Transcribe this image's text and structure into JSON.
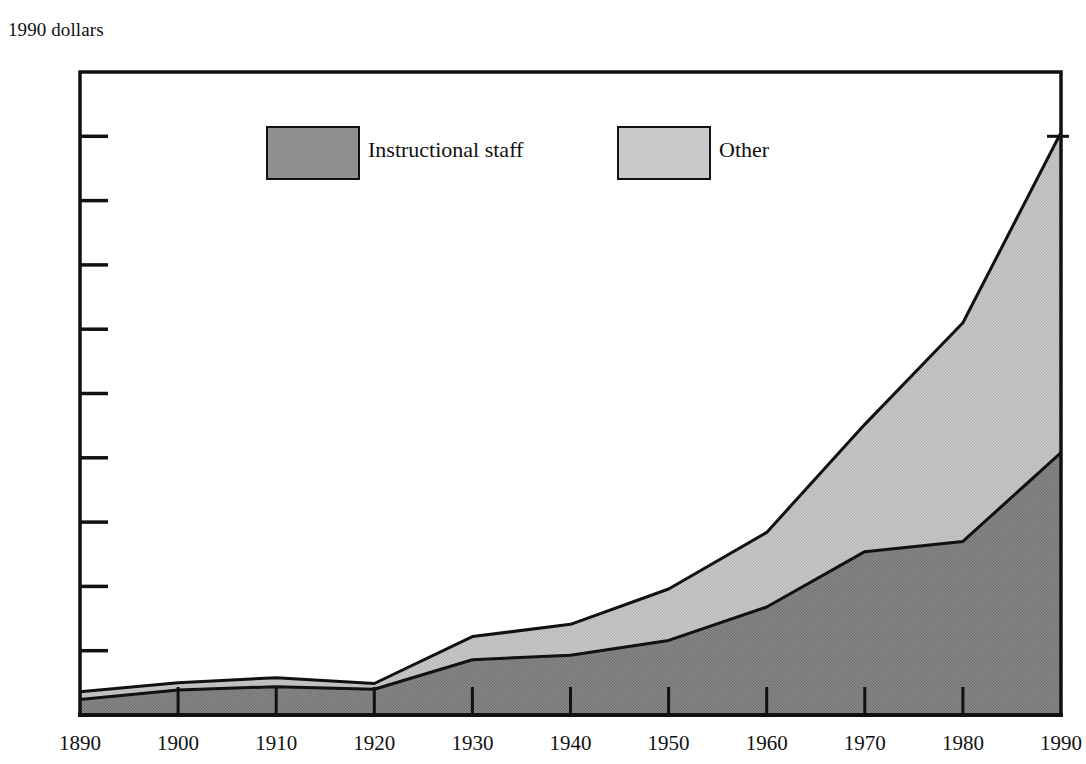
{
  "chart_data": {
    "type": "area",
    "title": "",
    "subtitle": "",
    "xlabel": "",
    "ylabel": "1990 dollars",
    "stacked": true,
    "grid": false,
    "legend_position": "top-center",
    "xlim": [
      1890,
      1990
    ],
    "ylim": [
      0,
      5000
    ],
    "x": [
      1890,
      1900,
      1910,
      1920,
      1930,
      1940,
      1950,
      1960,
      1970,
      1980,
      1990
    ],
    "categories": [
      "1890",
      "1900",
      "1910",
      "1920",
      "1930",
      "1940",
      "1950",
      "1960",
      "1970",
      "1980",
      "1990"
    ],
    "xticks": [
      "1890",
      "1900",
      "1910",
      "1920",
      "1930",
      "1940",
      "1950",
      "1960",
      "1970",
      "1980",
      "1990"
    ],
    "yticks": [
      "0",
      "500",
      "1,000",
      "1,500",
      "2,000",
      "2,500",
      "3,000",
      "3,500",
      "4,000",
      "4,500",
      "5,000"
    ],
    "ytick_values": [
      0,
      500,
      1000,
      1500,
      2000,
      2500,
      3000,
      3500,
      4000,
      4500,
      5000
    ],
    "series": [
      {
        "name": "Instructional staff",
        "color": "#8f8f8f",
        "values": [
          120,
          195,
          220,
          200,
          430,
          465,
          580,
          840,
          1270,
          1350,
          2040
        ]
      },
      {
        "name": "Other",
        "color": "#c9c9c9",
        "values": [
          60,
          55,
          70,
          45,
          180,
          240,
          400,
          580,
          990,
          1700,
          2490
        ]
      }
    ],
    "totals": [
      180,
      250,
      290,
      245,
      610,
      705,
      980,
      1420,
      2260,
      3050,
      4530
    ],
    "annotations": []
  },
  "legend": {
    "items": [
      {
        "label": "Instructional staff",
        "color": "#8f8f8f"
      },
      {
        "label": "Other",
        "color": "#c9c9c9"
      }
    ]
  },
  "axis": {
    "unit_label": "1990 dollars"
  },
  "colors": {
    "instructional_staff": "#8f8f8f",
    "other": "#c9c9c9",
    "axis": "#111111",
    "background": "#ffffff"
  }
}
